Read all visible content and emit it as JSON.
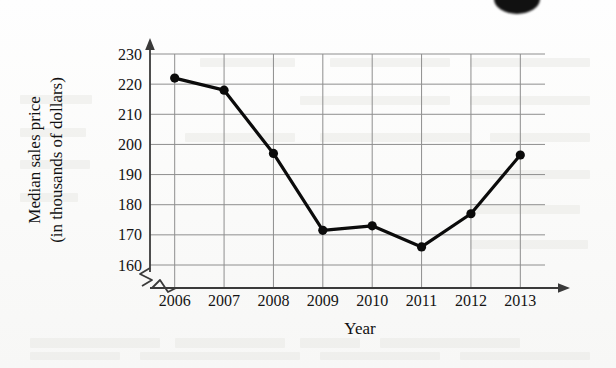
{
  "chart_data": {
    "type": "line",
    "title": "",
    "xlabel": "Year",
    "ylabel": "Median sales price (in thousands of dollars)",
    "ylabel_lines": [
      "Median sales price",
      "(in thousands of dollars)"
    ],
    "categories": [
      "2006",
      "2007",
      "2008",
      "2009",
      "2010",
      "2011",
      "2012",
      "2013"
    ],
    "values": [
      222,
      218,
      197,
      171.5,
      173,
      166,
      177,
      196.5
    ],
    "series": [
      {
        "name": "Median sales price",
        "values": [
          222,
          218,
          197,
          171.5,
          173,
          166,
          177,
          196.5
        ]
      }
    ],
    "yticks": [
      230,
      220,
      210,
      200,
      190,
      180,
      170,
      160
    ],
    "ylim": [
      160,
      232
    ],
    "xlim": [
      "2006",
      "2013"
    ],
    "grid": true,
    "legend": "none",
    "axis_break": true,
    "marker": "filled-circle",
    "line_color": "#0b0b0b",
    "grid_color": "#8e8e8e",
    "axis_color": "#3a3a3a"
  },
  "ghost_text_blocks": [
    {
      "x": 20,
      "y": 95,
      "w": 72,
      "h": 9
    },
    {
      "x": 20,
      "y": 128,
      "w": 66,
      "h": 9
    },
    {
      "x": 20,
      "y": 160,
      "w": 70,
      "h": 9
    },
    {
      "x": 20,
      "y": 193,
      "w": 58,
      "h": 9
    },
    {
      "x": 200,
      "y": 58,
      "w": 95,
      "h": 9
    },
    {
      "x": 330,
      "y": 58,
      "w": 120,
      "h": 9
    },
    {
      "x": 470,
      "y": 58,
      "w": 120,
      "h": 9
    },
    {
      "x": 300,
      "y": 96,
      "w": 150,
      "h": 9
    },
    {
      "x": 470,
      "y": 96,
      "w": 120,
      "h": 9
    },
    {
      "x": 185,
      "y": 133,
      "w": 110,
      "h": 9
    },
    {
      "x": 320,
      "y": 133,
      "w": 150,
      "h": 9
    },
    {
      "x": 490,
      "y": 133,
      "w": 100,
      "h": 9
    },
    {
      "x": 470,
      "y": 170,
      "w": 120,
      "h": 9
    },
    {
      "x": 470,
      "y": 205,
      "w": 110,
      "h": 9
    },
    {
      "x": 470,
      "y": 240,
      "w": 118,
      "h": 9
    },
    {
      "x": 30,
      "y": 338,
      "w": 130,
      "h": 10
    },
    {
      "x": 175,
      "y": 338,
      "w": 110,
      "h": 10
    },
    {
      "x": 300,
      "y": 338,
      "w": 60,
      "h": 10
    },
    {
      "x": 380,
      "y": 338,
      "w": 140,
      "h": 10
    },
    {
      "x": 30,
      "y": 352,
      "w": 90,
      "h": 8
    },
    {
      "x": 140,
      "y": 352,
      "w": 160,
      "h": 8
    },
    {
      "x": 320,
      "y": 352,
      "w": 120,
      "h": 8
    },
    {
      "x": 460,
      "y": 352,
      "w": 130,
      "h": 8
    }
  ]
}
